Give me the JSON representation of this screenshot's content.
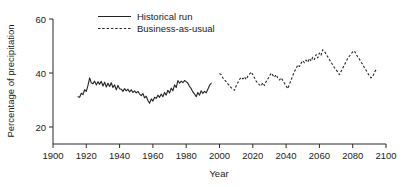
{
  "chart_data": {
    "type": "line",
    "title": "",
    "xlabel": "Year",
    "ylabel": "Percentage of precipitation",
    "xlim": [
      1900,
      2100
    ],
    "ylim": [
      10,
      62
    ],
    "xticks": [
      1900,
      1920,
      1940,
      1960,
      1980,
      2000,
      2020,
      2040,
      2060,
      2080,
      2100
    ],
    "yticks": [
      20,
      40,
      60
    ],
    "xticklabels": [
      "1900",
      "1920",
      "1940",
      "1960",
      "1980",
      "2000",
      "2020",
      "2040",
      "2060",
      "2080",
      "2100"
    ],
    "yticklabels": [
      "20",
      "40",
      "60"
    ],
    "grid": false,
    "legend_position": "upper-left-inside",
    "line_color": "#232323",
    "background_color": "#ffffff",
    "series": [
      {
        "name": "Historical run",
        "style": "solid",
        "x": [
          1915,
          1916,
          1917,
          1918,
          1919,
          1920,
          1921,
          1922,
          1923,
          1924,
          1925,
          1926,
          1927,
          1928,
          1929,
          1930,
          1931,
          1932,
          1933,
          1934,
          1935,
          1936,
          1937,
          1938,
          1939,
          1940,
          1941,
          1942,
          1943,
          1944,
          1945,
          1946,
          1947,
          1948,
          1949,
          1950,
          1951,
          1952,
          1953,
          1954,
          1955,
          1956,
          1957,
          1958,
          1959,
          1960,
          1961,
          1962,
          1963,
          1964,
          1965,
          1966,
          1967,
          1968,
          1969,
          1970,
          1971,
          1972,
          1973,
          1974,
          1975,
          1976,
          1977,
          1978,
          1979,
          1980,
          1981,
          1982,
          1983,
          1984,
          1985,
          1986,
          1987,
          1988,
          1989,
          1990,
          1991,
          1992,
          1993,
          1994,
          1995
        ],
        "values": [
          31.2,
          31.0,
          32.5,
          32.0,
          33.8,
          33.2,
          35.4,
          38.2,
          36.4,
          36.0,
          37.0,
          35.6,
          36.8,
          35.8,
          36.9,
          35.2,
          36.6,
          34.8,
          36.2,
          35.0,
          36.4,
          34.6,
          35.6,
          33.8,
          35.4,
          34.2,
          34.0,
          33.2,
          34.2,
          33.4,
          34.0,
          33.0,
          33.8,
          32.8,
          33.4,
          32.6,
          33.2,
          32.2,
          31.6,
          32.4,
          30.8,
          31.4,
          29.8,
          28.8,
          30.4,
          29.6,
          31.0,
          30.6,
          31.8,
          31.0,
          32.2,
          31.2,
          32.8,
          31.8,
          33.6,
          32.6,
          34.4,
          33.4,
          35.6,
          34.6,
          37.2,
          36.2,
          37.0,
          36.4,
          37.2,
          36.8,
          36.2,
          35.0,
          34.2,
          33.0,
          32.2,
          31.2,
          32.8,
          31.8,
          33.4,
          32.4,
          33.2,
          32.6,
          34.0,
          35.4,
          36.2
        ]
      },
      {
        "name": "Business-as-usual",
        "style": "dashed",
        "x": [
          2000,
          2001,
          2002,
          2003,
          2004,
          2005,
          2006,
          2007,
          2008,
          2009,
          2010,
          2011,
          2012,
          2013,
          2014,
          2015,
          2016,
          2017,
          2018,
          2019,
          2020,
          2021,
          2022,
          2023,
          2024,
          2025,
          2026,
          2027,
          2028,
          2029,
          2030,
          2031,
          2032,
          2033,
          2034,
          2035,
          2036,
          2037,
          2038,
          2039,
          2040,
          2041,
          2042,
          2043,
          2044,
          2045,
          2046,
          2047,
          2048,
          2049,
          2050,
          2051,
          2052,
          2053,
          2054,
          2055,
          2056,
          2057,
          2058,
          2059,
          2060,
          2061,
          2062,
          2063,
          2064,
          2065,
          2066,
          2067,
          2068,
          2069,
          2070,
          2071,
          2072,
          2073,
          2074,
          2075,
          2076,
          2077,
          2078,
          2079,
          2080,
          2081,
          2082,
          2083,
          2084,
          2085,
          2086,
          2087,
          2088,
          2089,
          2090,
          2091,
          2092,
          2093,
          2094,
          2095
        ],
        "values": [
          39.8,
          39.4,
          38.2,
          37.4,
          36.8,
          36.0,
          35.4,
          34.6,
          34.0,
          33.6,
          35.2,
          36.4,
          37.6,
          38.4,
          37.8,
          38.6,
          37.6,
          38.8,
          39.6,
          40.4,
          39.4,
          38.2,
          37.0,
          36.2,
          35.6,
          35.2,
          36.4,
          35.4,
          36.8,
          37.8,
          38.8,
          40.0,
          39.2,
          38.4,
          39.4,
          38.2,
          37.4,
          38.2,
          37.2,
          36.2,
          35.2,
          34.2,
          35.8,
          37.4,
          39.0,
          40.6,
          41.6,
          43.0,
          42.4,
          43.6,
          44.6,
          43.8,
          44.8,
          44.0,
          45.4,
          44.4,
          45.8,
          45.0,
          46.8,
          45.6,
          47.4,
          46.6,
          48.6,
          48.0,
          47.0,
          46.0,
          45.0,
          44.0,
          43.0,
          42.0,
          41.2,
          40.4,
          39.4,
          40.6,
          41.8,
          43.0,
          44.2,
          45.4,
          46.2,
          47.0,
          47.8,
          48.2,
          47.0,
          46.0,
          45.2,
          44.0,
          43.2,
          42.0,
          41.0,
          40.0,
          39.0,
          38.2,
          38.6,
          40.2,
          41.2,
          41.0
        ]
      }
    ]
  },
  "legend": {
    "items": [
      {
        "label": "Historical run",
        "style": "solid"
      },
      {
        "label": "Business-as-usual",
        "style": "dashed"
      }
    ]
  }
}
